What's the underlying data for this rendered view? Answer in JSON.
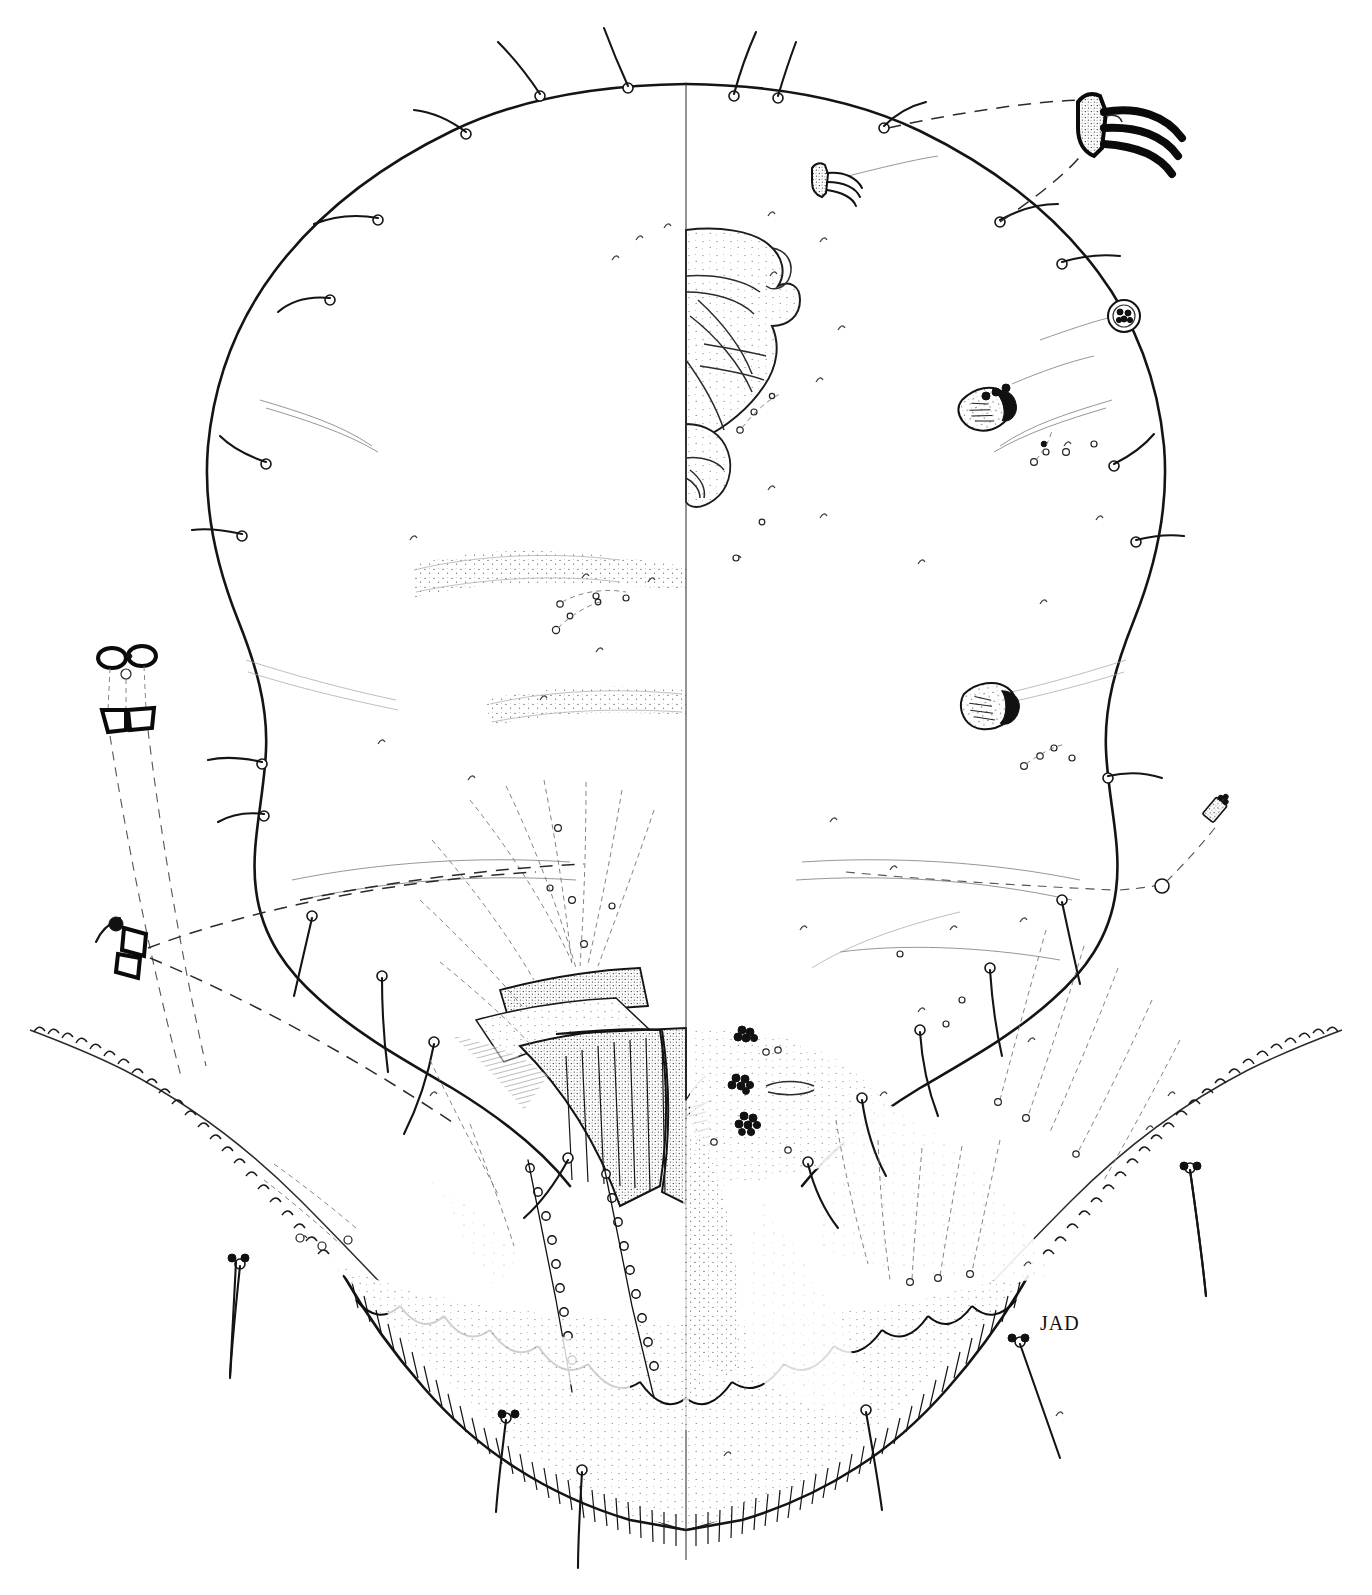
{
  "figure": {
    "domain": "scientific-illustration",
    "view_convention": "split illustration: dorsal surface shown on left half, ventral surface shown on right half, divided by a vertical body midline",
    "medium": "black ink line drawing on white paper",
    "background_color": "#ffffff",
    "ink_color": "#111111",
    "signature": "JAD",
    "signature_position": "lower right of the abdominal margin"
  },
  "body": {
    "outline_label": "body derm outline",
    "shape": "broadly oval, widest across the mid-abdomen, narrowing slightly anteriorly",
    "margin_anterior": "smooth rounded curve bearing evenly spaced marginal setae",
    "margin_posterior": "deeply crenulate / serrate lateral lobes flanking the anal cleft",
    "midline_label": "body midline",
    "left_half_label": "dorsum",
    "right_half_label": "venter"
  },
  "structures": [
    {
      "id": "marginal-setae",
      "label": "marginal setae",
      "description": "long curved flagellate setae with swollen bulbous basal sockets, arranged in a single row around the body margin",
      "count_visible": 26
    },
    {
      "id": "mouthparts",
      "label": "clypeolabral shield and stylet loop",
      "description": "large stippled sclerotised shield on the ventral midline anteriorly, with rostrum and crossing stylets",
      "position": "anterior ventral midline"
    },
    {
      "id": "labium",
      "label": "labium",
      "description": "small two-segmented stippled lobe posterior to the clypeolabral shield"
    },
    {
      "id": "anterior-spiracle",
      "label": "anterior spiracle",
      "description": "sclerotised peritreme with atrium, enlarged in inset"
    },
    {
      "id": "posterior-spiracle",
      "label": "posterior spiracle",
      "description": "sclerotised peritreme with atrium, enlarged in inset"
    },
    {
      "id": "spiracular-pore-band",
      "label": "spiracular quinquelocular pore band",
      "description": "narrow band of small pores running from each spiracle to the margin"
    },
    {
      "id": "dorsal-pore-bands",
      "label": "transverse dorsal pore bands",
      "description": "two broad faint stippled transverse bands of minute dorsal pores across the dorsum"
    },
    {
      "id": "anal-plates",
      "label": "anal plates / anal ring",
      "description": "paired triangular sclerotised plates over the anal opening, heavily stippled, bearing setae"
    },
    {
      "id": "anal-ring-setae",
      "label": "anal ring setae",
      "description": "comb-like fringe of fine setae emerging at the anal ring"
    },
    {
      "id": "vulva",
      "label": "vulva",
      "description": "transverse slit on the ventral midline posterior to the anal plates"
    },
    {
      "id": "multilocular-pores",
      "label": "multilocular disc pores",
      "description": "dark rosette clusters of multilocular pores arranged in groups around the vulvar area on the venter"
    },
    {
      "id": "tubular-ducts",
      "label": "tubular ducts",
      "description": "dashed elongate ducts radiating from the posterior body region"
    },
    {
      "id": "anal-lobes",
      "label": "anal lobes",
      "description": "paired sclerotised posterior lobes with apical setae flanking the anal cleft"
    },
    {
      "id": "cribriform-plates",
      "label": "cribriform plates",
      "description": "small rounded perforated plates on the dorsum, shown enlarged"
    },
    {
      "id": "quadrilocular-pores",
      "label": "quadrilocular pores",
      "description": "small rosette pores scattered over the derm"
    },
    {
      "id": "dorsal-setae",
      "label": "dorsal setae",
      "description": "minute hair-like setae scattered sparsely over the dorsum and venter"
    },
    {
      "id": "antenna",
      "label": "antenna",
      "description": "reduced tubercle-like antenna near anterior margin"
    },
    {
      "id": "crenulate-margin",
      "label": "crenulate posterior margin",
      "description": "row of scalloped marginal crenulations along the abdominal margin"
    },
    {
      "id": "marginal-fringe",
      "label": "marginal fringe of fine hairs",
      "description": "dense hatched fringe along the posterior abdominal margin"
    }
  ],
  "insets": [
    {
      "id": "inset-trilocular-large",
      "label": "enlarged tubular duct with three terminal filaments",
      "position": "upper right corner",
      "connector": "long-dashed leader line to dorsal margin"
    },
    {
      "id": "inset-trilocular-small",
      "label": "tubular duct with terminal filaments, lower magnification",
      "position": "upper centre-right",
      "connector": "fine leader line"
    },
    {
      "id": "inset-cribriform",
      "label": "cribriform plate, enlarged",
      "position": "right upper, circular outline",
      "connector": "fine leader line to dorsum"
    },
    {
      "id": "inset-anterior-spiracle",
      "label": "anterior spiracle, enlarged",
      "position": "right side, upper",
      "connector": "fine leader line"
    },
    {
      "id": "inset-posterior-spiracle",
      "label": "posterior spiracle, enlarged",
      "position": "right side, middle",
      "connector": "fine leader line"
    },
    {
      "id": "inset-multilocular-right",
      "label": "multilocular disc pore, enlarged",
      "position": "far right margin",
      "connector": "long dashed leader line to ventral derm"
    },
    {
      "id": "inset-pore-pair",
      "label": "paired dorsal pores with ducts, enlarged",
      "position": "left upper, outside body outline",
      "connector": "long dashed leader lines to dorsum"
    },
    {
      "id": "inset-duct-sclerite",
      "label": "sclerotised duct / marginal sclerite, enlarged",
      "position": "left lower, outside body outline",
      "connector": "long dashed leader line to margin"
    }
  ],
  "counts": {
    "marginal_setae_left": 13,
    "marginal_setae_right": 13,
    "multilocular_pore_clusters": 4,
    "dorsal_pore_bands": 2,
    "spiracles_per_side": 2
  }
}
